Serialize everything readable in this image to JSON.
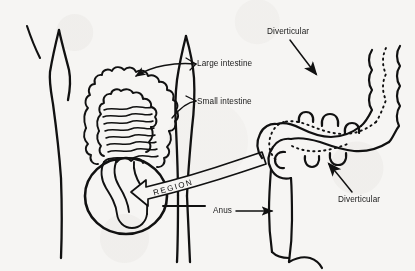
{
  "figure": {
    "background_color": "#f6f5f3",
    "ink_color": "#111111",
    "width": 415,
    "height": 271
  },
  "labels": {
    "large_intestine": "Large intestine",
    "small_intestine": "Small intestine",
    "diverticular_top": "Diverticular",
    "diverticular_bottom": "Diverticular",
    "anus": "Anus",
    "ribbon": "REGION"
  },
  "annotations": [
    {
      "name": "large-intestine-leader",
      "label": "Large intestine",
      "style": "curved-arrow",
      "points_to": "transverse-colon"
    },
    {
      "name": "small-intestine-leader",
      "label": "Small intestine",
      "style": "short-tick",
      "points_to": "small-intestine-coils"
    },
    {
      "name": "diverticular-top-leader",
      "label": "Diverticular",
      "style": "curved-arrow",
      "points_to": "colon-pouch-upper"
    },
    {
      "name": "diverticular-bottom-leader",
      "label": "Diverticular",
      "style": "straight-arrow",
      "points_to": "colon-pouch-lower"
    },
    {
      "name": "anus-leader",
      "label": "Anus",
      "style": "straight-arrow",
      "points_to": "anal-canal"
    },
    {
      "name": "region-ribbon-arrow",
      "label": "REGION",
      "style": "curved-ribbon-arrow",
      "points_to": "circled-sigmoid-region"
    }
  ],
  "anatomy": [
    {
      "name": "body-outline-left",
      "description": "left torso and hip contour"
    },
    {
      "name": "body-outline-arm",
      "description": "short diagonal arm stroke"
    },
    {
      "name": "body-outline-right",
      "description": "right torso, hip and leg contour"
    },
    {
      "name": "large-intestine",
      "description": "bumpy haustrated colon frame"
    },
    {
      "name": "small-intestine",
      "description": "coiled small bowel loops"
    },
    {
      "name": "sigmoid-region-circle",
      "description": "bold circle highlighting sigmoid and rectum"
    },
    {
      "name": "diverticular-colon",
      "description": "magnified colon with diverticular pouches"
    },
    {
      "name": "rectum",
      "description": "descending rectum and anal canal"
    }
  ]
}
